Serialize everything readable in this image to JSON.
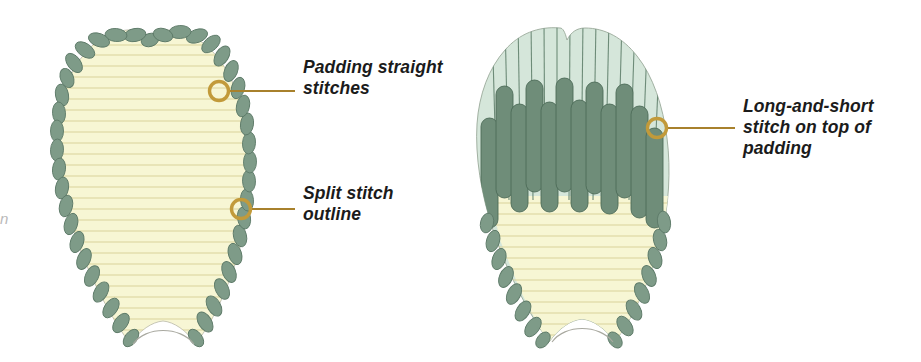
{
  "figure": {
    "background_color": "#ffffff",
    "panels": [
      {
        "id": "left-petal",
        "name": "Petal with padding straight stitches and split stitch outline",
        "description": "Heart-shaped petal outlined with a row of split stitches, filled with horizontal padding straight stitches over a pale yellow ground."
      },
      {
        "id": "right-petal",
        "name": "Petal worked in long-and-short stitch over padding",
        "description": "Same petal shape part-covered with vertical long-and-short stitches in sage green worked on top of the padding; the lower unworked area still shows the yellow padding."
      }
    ]
  },
  "callouts": [
    {
      "id": "padding-straight-stitches",
      "label": "Padding straight\nstitches",
      "marker": {
        "cx": 219,
        "cy": 91,
        "r": 10
      },
      "leader": {
        "x1": 229,
        "y1": 91,
        "x2": 295,
        "y2": 91
      }
    },
    {
      "id": "split-stitch-outline",
      "label": "Split stitch\noutline",
      "marker": {
        "cx": 241,
        "cy": 209,
        "r": 10
      },
      "leader": {
        "x1": 251,
        "y1": 209,
        "x2": 295,
        "y2": 209
      }
    },
    {
      "id": "long-and-short-stitch",
      "label": "Long-and-short\nstitch on top of\npadding",
      "marker": {
        "cx": 657,
        "cy": 128,
        "r": 10
      },
      "leader": {
        "x1": 667,
        "y1": 128,
        "x2": 735,
        "y2": 128
      }
    }
  ],
  "colors": {
    "callout_ring": "#c29a3a",
    "leader_line": "#a8812c",
    "text": "#1b1b1b",
    "padding_fill": "#f7f6d4",
    "padding_line": "#ddd7a0",
    "split_stitch_green": "#7e9b88",
    "split_stitch_edge": "#5d7a68",
    "long_short_light": "#d5e6da",
    "long_short_light_line": "#6d8b78",
    "long_short_dark": "#6f8d79",
    "long_short_dark_edge": "#4d6b58",
    "shape_outline": "#9aa99a",
    "page_background": "#ffffff"
  },
  "edge_artifact": {
    "glyph": "n"
  }
}
